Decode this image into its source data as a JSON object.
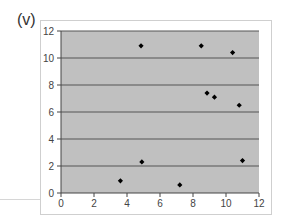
{
  "panel_label": "(v)",
  "chart_data": {
    "type": "scatter",
    "title": "",
    "xlabel": "",
    "ylabel": "",
    "xlim": [
      0,
      12
    ],
    "ylim": [
      0,
      12
    ],
    "x_ticks": [
      0,
      2,
      4,
      6,
      8,
      10,
      12
    ],
    "y_ticks": [
      0,
      2,
      4,
      6,
      8,
      10,
      12
    ],
    "grid": "horizontal",
    "legend": null,
    "series": [
      {
        "name": "points",
        "marker": "diamond",
        "color": "#000000",
        "points": [
          {
            "x": 4.85,
            "y": 10.9
          },
          {
            "x": 8.5,
            "y": 10.9
          },
          {
            "x": 10.4,
            "y": 10.4
          },
          {
            "x": 8.85,
            "y": 7.4
          },
          {
            "x": 9.3,
            "y": 7.1
          },
          {
            "x": 10.8,
            "y": 6.5
          },
          {
            "x": 4.9,
            "y": 2.3
          },
          {
            "x": 11.0,
            "y": 2.4
          },
          {
            "x": 3.6,
            "y": 0.9
          },
          {
            "x": 7.2,
            "y": 0.6
          }
        ]
      }
    ],
    "colors": {
      "plot_background": "#c0c0c0",
      "gridline": "#555555",
      "axis": "#444444",
      "frame": "#cfcfcf"
    }
  }
}
